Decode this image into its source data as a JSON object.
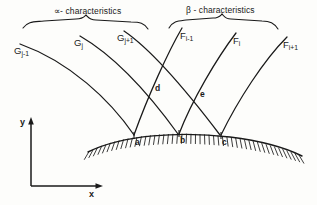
{
  "figure": {
    "title_alpha": "∝- characteristics",
    "title_beta": "β - characteristics",
    "stroke_color": "#1a1a1a",
    "background_color": "#fdfdfb"
  },
  "alpha_curves": [
    {
      "id": "g-j-minus-1",
      "label_base": "G",
      "label_sub": "j-1",
      "x": 14,
      "y": 46
    },
    {
      "id": "g-j",
      "label_base": "G",
      "label_sub": "j",
      "x": 74,
      "y": 38
    },
    {
      "id": "g-j-plus-1",
      "label_base": "G",
      "label_sub": "j+1",
      "x": 117,
      "y": 33
    }
  ],
  "beta_curves": [
    {
      "id": "f-i-minus-1",
      "label_base": "F",
      "label_sub": "i-1",
      "x": 180,
      "y": 31
    },
    {
      "id": "f-i",
      "label_base": "F",
      "label_sub": "i",
      "x": 233,
      "y": 36
    },
    {
      "id": "f-i-plus-1",
      "label_base": "F",
      "label_sub": "i+1",
      "x": 283,
      "y": 40
    }
  ],
  "intersection_points": [
    {
      "id": "point-d",
      "label": "d",
      "x": 155,
      "y": 88
    },
    {
      "id": "point-e",
      "label": "e",
      "x": 200,
      "y": 94
    }
  ],
  "surface_points": [
    {
      "id": "point-a",
      "label": "a",
      "x": 134,
      "y": 138
    },
    {
      "id": "point-b",
      "label": "b",
      "x": 180,
      "y": 136
    },
    {
      "id": "point-c",
      "label": "c",
      "x": 221,
      "y": 138
    }
  ],
  "axes": {
    "y_label": "y",
    "x_label": "x"
  }
}
